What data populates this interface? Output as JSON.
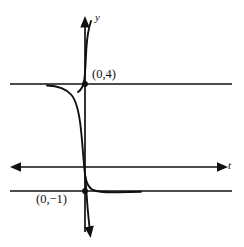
{
  "figure": {
    "name": "logistic-curve-with-two-horizontal-asymptotes",
    "background_color": "#ffffff",
    "ink_color": "#101010",
    "axes": {
      "vertical": {
        "label": "y",
        "x_px": 85,
        "top_px": 18,
        "bottom_px": 238,
        "arrow_top": true,
        "arrow_bottom": false
      },
      "horizontal": {
        "label": "t",
        "y_px": 167,
        "left_px": 12,
        "right_px": 226,
        "arrow_left": true,
        "arrow_right": true
      }
    },
    "asymptotes": [
      {
        "name": "upper-asymptote",
        "value": 4,
        "y_px": 84,
        "x_start_px": 10,
        "x_end_px": 232
      },
      {
        "name": "lower-asymptote",
        "value": -1,
        "y_px": 191,
        "x_start_px": 10,
        "x_end_px": 232
      }
    ],
    "points": [
      {
        "name": "y-intercept-upper-branch",
        "label": "(0,4)",
        "x": 0,
        "y": 4,
        "x_px": 85,
        "y_px": 84
      },
      {
        "name": "y-intercept-lower-branch",
        "label": "(0,−1)",
        "x": 0,
        "y": -1,
        "x_px": 85,
        "y_px": 191
      }
    ],
    "branches": [
      {
        "name": "upper-left-branch",
        "description": "rises from lower-left along lower region, hugs the x-axis region then climbs steeply through (0,4) to the top arrow"
      },
      {
        "name": "middle-descending-branch",
        "description": "comes in flat from the left along the upper asymptote y=4, then falls steeply through the t-axis near t=0"
      },
      {
        "name": "lower-right-branch",
        "description": "descends steeply through (0,−1) to the bottom arrow and flattens out rightward along the lower asymptote y=−1"
      }
    ]
  }
}
